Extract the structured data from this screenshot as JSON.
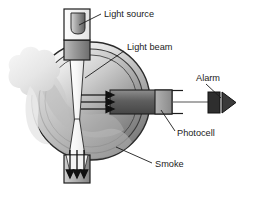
{
  "diagram": {
    "type": "schematic",
    "background_color": "#ffffff",
    "labels": {
      "light_source": "Light source",
      "light_beam": "Light beam",
      "alarm": "Alarm",
      "photocell": "Photocell",
      "smoke": "Smoke"
    },
    "parts": {
      "chamber": {
        "name": "detection-chamber",
        "shape": "circle",
        "fill_light": "#f2f2f2",
        "fill_dark": "#6e6e6e",
        "stroke": "#2a2a2a"
      },
      "inner_ring": {
        "name": "chamber-inner-ring",
        "stroke": "#3a3a3a"
      },
      "light_source_housing": {
        "name": "light-source-housing",
        "fill": "#e8e8e8",
        "stroke": "#1d1d1d"
      },
      "bulb": {
        "name": "light-bulb",
        "fill_light": "#d8d8d8",
        "fill_dark": "#6a6a6a",
        "stroke": "#2b2b2b"
      },
      "collimator_tube": {
        "name": "collimator-tube",
        "fill_light": "#b4b4b4",
        "fill_dark": "#707070",
        "stroke": "#1d1d1d"
      },
      "light_beam": {
        "name": "light-beam-cone",
        "fill": "#fafafa",
        "stroke": "#2a2a2a",
        "shape": "hourglass"
      },
      "bottom_tube": {
        "name": "bottom-exit-tube",
        "fill_light": "#cfcfcf",
        "fill_dark": "#8a8a8a",
        "stroke": "#1d1d1d"
      },
      "photocell_tube": {
        "name": "photocell-tube",
        "fill_light": "#8d8d8d",
        "fill_dark": "#4a4a4a",
        "stroke": "#1d1d1d"
      },
      "photocell": {
        "name": "photocell-element",
        "fill": "#9a9a9a",
        "stroke": "#1d1d1d"
      },
      "alarm_box": {
        "name": "alarm-box",
        "fill": "#2e2e2e",
        "stroke": "#111111"
      },
      "alarm_horn": {
        "name": "alarm-horn-triangle",
        "fill": "#3a3a3a",
        "stroke": "#111111"
      },
      "smoke_cloud": {
        "name": "smoke-cloud",
        "fill": "#ededed",
        "stroke": "none"
      },
      "scatter_arrows": {
        "name": "scattered-light-arrows",
        "count": 3,
        "direction": "right",
        "color": "#111111"
      },
      "beam_arrows": {
        "name": "beam-exit-arrows",
        "count": 3,
        "direction": "down",
        "color": "#111111"
      },
      "leader_lines": {
        "name": "label-leader-lines",
        "color": "#1b1b1b"
      }
    }
  }
}
